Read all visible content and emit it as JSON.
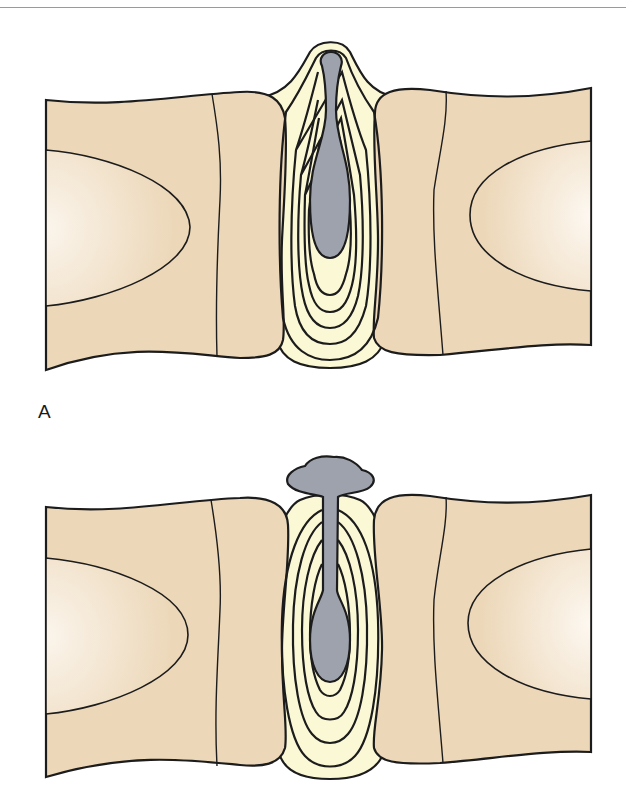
{
  "figure": {
    "colors": {
      "vertebra_fill": "#ecd7b8",
      "vertebra_highlight": "#f8efe2",
      "annulus_fill": "#fbf8d6",
      "nucleus_fill": "#9ea2ad",
      "outline": "#1c1c1c",
      "rule": "#9a9a9a"
    },
    "panels": [
      {
        "label": "A",
        "state": "protrusion - nucleus contained within annulus"
      },
      {
        "label": "",
        "state": "extrusion - nucleus extruded through annulus"
      }
    ]
  }
}
